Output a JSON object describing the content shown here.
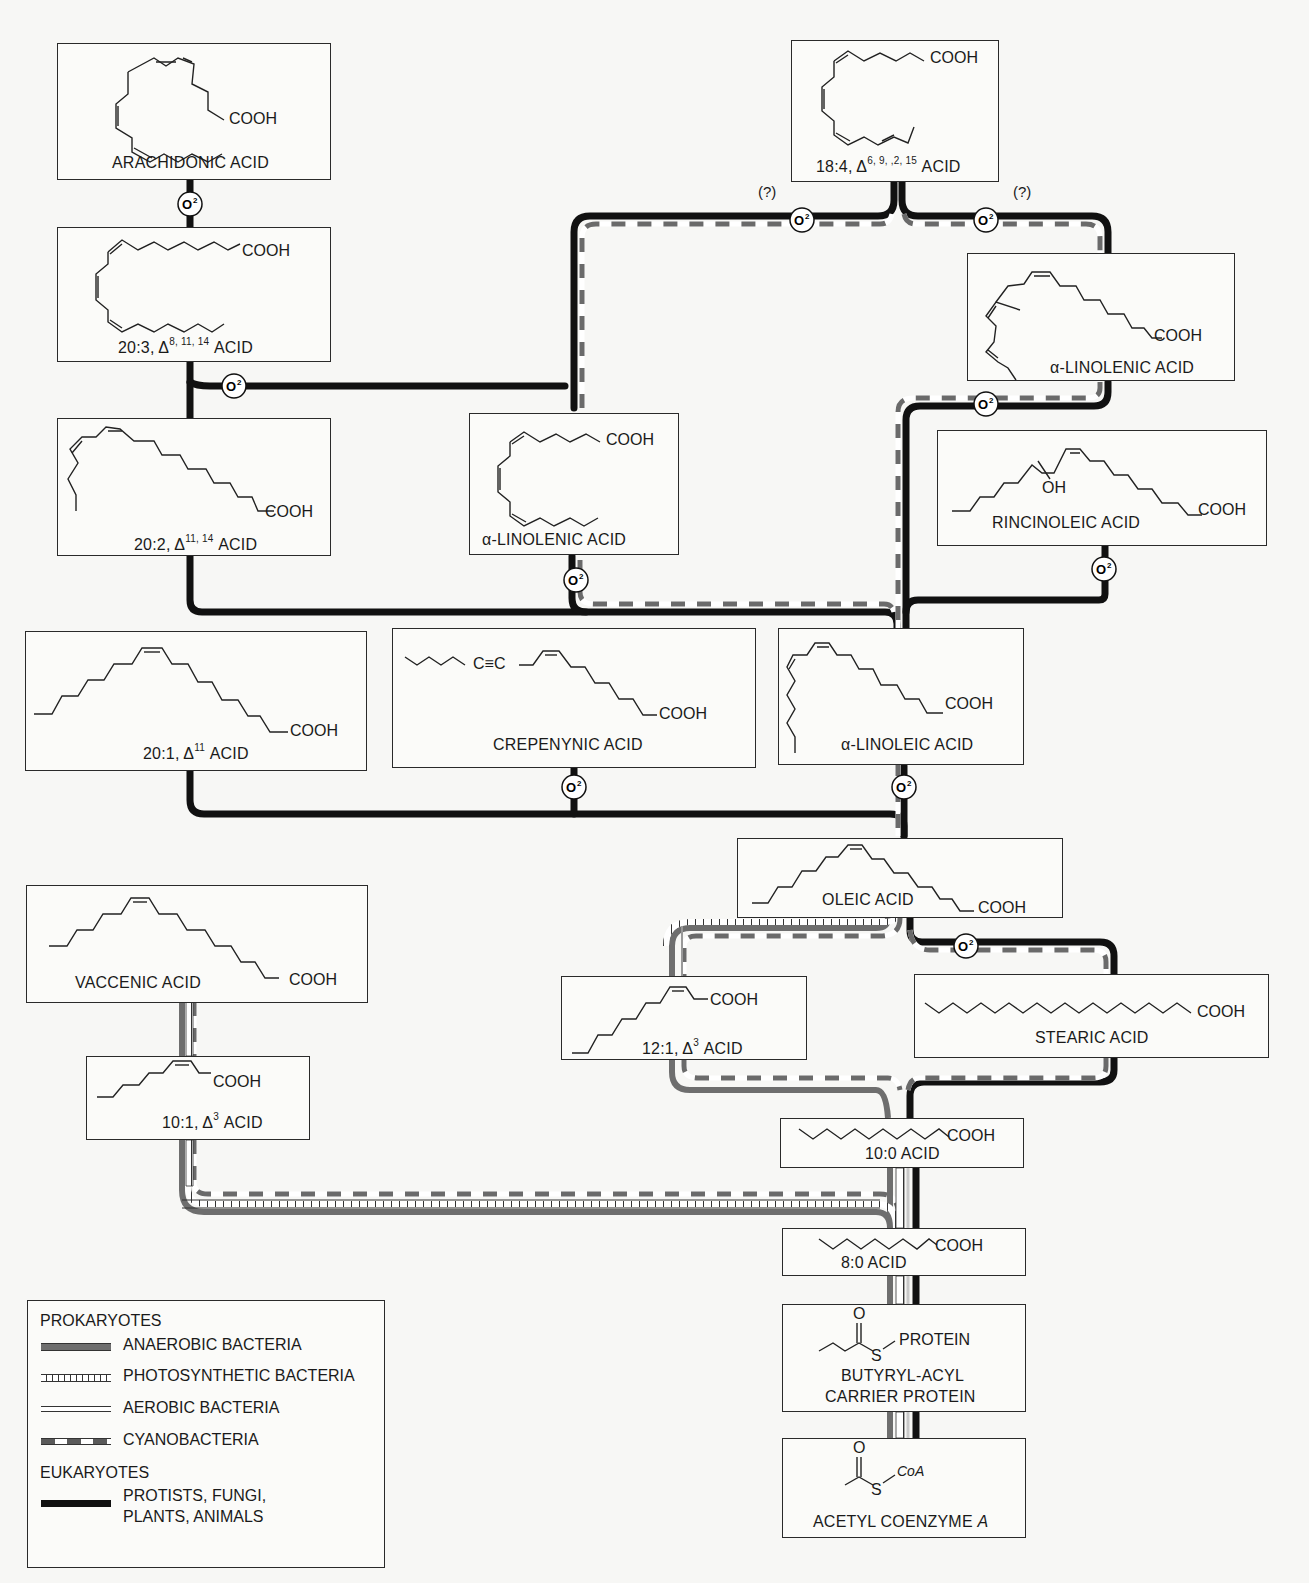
{
  "diagram": {
    "type": "fatty-acid-biosynthesis-pathways",
    "oxygen_marker": "O²",
    "uncertain_marker": "(?)"
  },
  "compounds": {
    "arachidonic": {
      "name": "ARACHIDONIC ACID",
      "group": "COOH"
    },
    "c20_3": {
      "name_pre": "20:3, Δ",
      "sup": "8, 11, 14",
      "name_post": " ACID",
      "group": "COOH"
    },
    "c20_2": {
      "name_pre": "20:2, Δ",
      "sup": "11, 14",
      "name_post": " ACID",
      "group": "COOH"
    },
    "c20_1": {
      "name_pre": "20:1, Δ",
      "sup": "11",
      "name_post": " ACID",
      "group": "COOH"
    },
    "c18_4": {
      "name_pre": "18:4, Δ",
      "sup": "6, 9, ,2, 15",
      "name_post": " ACID",
      "group": "COOH"
    },
    "linolenic_center": {
      "name": "α-LINOLENIC ACID",
      "group": "COOH"
    },
    "linolenic_right": {
      "name": "α-LINOLENIC ACID",
      "group": "COOH"
    },
    "ricinoleic": {
      "name": "RINCINOLEIC ACID",
      "group": "COOH",
      "hydroxyl": "OH"
    },
    "crepenynic": {
      "name": "CREPENYNIC ACID",
      "group": "COOH",
      "triple_bond": "C≡C"
    },
    "linoleic": {
      "name": "α-LINOLEIC ACID",
      "group": "COOH"
    },
    "oleic": {
      "name": "OLEIC ACID",
      "group": "COOH"
    },
    "vaccenic": {
      "name": "VACCENIC ACID",
      "group": "COOH"
    },
    "c10_1": {
      "name_pre": "10:1, Δ",
      "sup": "3",
      "name_post": " ACID",
      "group": "COOH"
    },
    "c12_1": {
      "name_pre": "12:1, Δ",
      "sup": "3",
      "name_post": " ACID",
      "group": "COOH"
    },
    "stearic": {
      "name": "STEARIC ACID",
      "group": "COOH"
    },
    "c10_0": {
      "name": "10:0 ACID",
      "group": "COOH"
    },
    "c8_0": {
      "name": "8:0 ACID",
      "group": "COOH"
    },
    "butyryl_acp": {
      "line1": "BUTYRYL-ACYL",
      "line2": "CARRIER PROTEIN",
      "carbonyl_o": "O",
      "sulfur": "S",
      "group": "PROTEIN"
    },
    "acetyl_coa": {
      "name_pre": "ACETYL COENZYME ",
      "name_italic": "A",
      "carbonyl_o": "O",
      "sulfur": "S",
      "group": "CoA"
    }
  },
  "legend": {
    "prokaryotes_heading": "PROKARYOTES",
    "eukaryotes_heading": "EUKARYOTES",
    "items": [
      {
        "label": "ANAEROBIC BACTERIA",
        "style": "anaerobic",
        "color": "#6e6e6e"
      },
      {
        "label": "PHOTOSYNTHETIC BACTERIA",
        "style": "photosynthetic",
        "color": "#ffffff"
      },
      {
        "label": "AEROBIC BACTERIA",
        "style": "aerobic",
        "color": "#c8c8c8"
      },
      {
        "label": "CYANOBACTERIA",
        "style": "cyanobacteria",
        "color": "#5a5a5a"
      },
      {
        "label_line1": "PROTISTS, FUNGI,",
        "label_line2": "PLANTS, ANIMALS",
        "style": "eukaryote",
        "color": "#111111"
      }
    ]
  }
}
